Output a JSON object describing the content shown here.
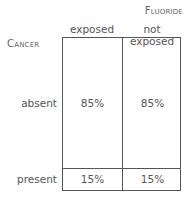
{
  "column_variable": "Fluoride",
  "row_variable": "Cancer",
  "columns": [
    "exposed",
    "not exposed"
  ],
  "rows": [
    {
      "label": "absent",
      "values": [
        "85%",
        "85%"
      ]
    },
    {
      "label": "present",
      "values": [
        "15%",
        "15%"
      ]
    }
  ]
}
